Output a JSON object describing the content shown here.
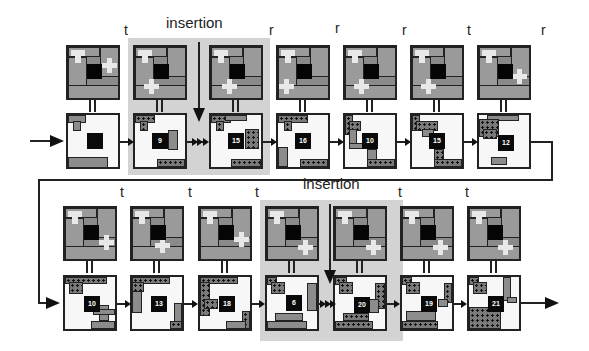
{
  "diagram": {
    "highlights": [
      {
        "label": "insertion",
        "row": 1
      },
      {
        "label": "insertion",
        "row": 2
      }
    ],
    "row1": {
      "stages": [
        {
          "op_label": "",
          "number": ""
        },
        {
          "op_label": "t",
          "number": "9"
        },
        {
          "op_label": "r",
          "number": "15"
        },
        {
          "op_label": "r",
          "number": "16"
        },
        {
          "op_label": "r",
          "number": "10"
        },
        {
          "op_label": "t",
          "number": "15"
        },
        {
          "op_label": "r",
          "number": "12"
        }
      ]
    },
    "row2": {
      "stages": [
        {
          "op_label": "t",
          "number": "10"
        },
        {
          "op_label": "t",
          "number": "13"
        },
        {
          "op_label": "t",
          "number": "18"
        },
        {
          "op_label": "",
          "number": "6"
        },
        {
          "op_label": "t",
          "number": "20"
        },
        {
          "op_label": "t",
          "number": "19"
        },
        {
          "op_label": "",
          "number": "21"
        }
      ]
    },
    "colors": {
      "highlight": "#d3d3d3",
      "piece_dark": "#8a8a8a",
      "center": "#050505",
      "light_piece": "#e8e8e8",
      "board_bg": "#f7f7f7"
    }
  }
}
